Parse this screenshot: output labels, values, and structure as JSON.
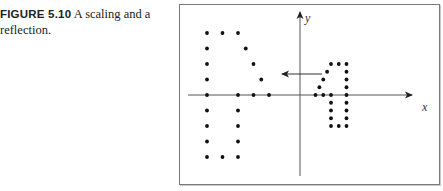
{
  "caption": {
    "label": "FIGURE 5.10",
    "text": " A scaling and a reflection."
  },
  "chart_data": {
    "type": "scatter",
    "title": "A scaling and a reflection",
    "xlabel": "x",
    "ylabel": "y",
    "grid": false,
    "annotations": [
      "arrow pointing left from the original figure to its scaled/reflected image"
    ],
    "series": [
      {
        "name": "original",
        "points": [
          [
            2,
            0
          ],
          [
            3,
            0
          ],
          [
            4,
            0
          ],
          [
            6,
            0
          ],
          [
            2.5,
            1
          ],
          [
            3,
            2
          ],
          [
            3.5,
            3
          ],
          [
            4,
            4
          ],
          [
            5,
            4
          ],
          [
            6,
            4
          ],
          [
            6,
            3
          ],
          [
            6,
            2
          ],
          [
            6,
            1
          ],
          [
            4,
            -1
          ],
          [
            4,
            -2
          ],
          [
            4,
            -3
          ],
          [
            4,
            -4
          ],
          [
            5,
            -4
          ],
          [
            6,
            -1
          ],
          [
            6,
            -2
          ],
          [
            6,
            -3
          ],
          [
            6,
            -4
          ]
        ]
      },
      {
        "name": "image",
        "points": [
          [
            -4,
            0
          ],
          [
            -6,
            0
          ],
          [
            -8,
            0
          ],
          [
            -12,
            0
          ],
          [
            -5,
            2
          ],
          [
            -6,
            4
          ],
          [
            -7,
            6
          ],
          [
            -8,
            8
          ],
          [
            -10,
            8
          ],
          [
            -12,
            8
          ],
          [
            -12,
            6
          ],
          [
            -12,
            4
          ],
          [
            -12,
            2
          ],
          [
            -8,
            -2
          ],
          [
            -8,
            -4
          ],
          [
            -8,
            -6
          ],
          [
            -8,
            -8
          ],
          [
            -10,
            -8
          ],
          [
            -12,
            -2
          ],
          [
            -12,
            -4
          ],
          [
            -12,
            -6
          ],
          [
            -12,
            -8
          ]
        ]
      }
    ]
  }
}
